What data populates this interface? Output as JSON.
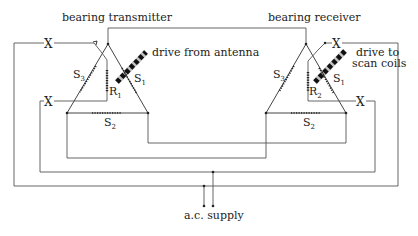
{
  "labels": {
    "transmitter": "bearing transmitter",
    "receiver": "bearing receiver",
    "drive_from": "drive from antenna",
    "drive_to_line1": "drive to",
    "drive_to_line2": "scan coils",
    "supply": "a.c. supply",
    "cross": "X"
  },
  "transmitter_windings": {
    "s1": {
      "letter": "S",
      "sub": "1"
    },
    "s2": {
      "letter": "S",
      "sub": "2"
    },
    "s3": {
      "letter": "S",
      "sub": "3"
    },
    "rotor": {
      "letter": "R",
      "sub": "1"
    }
  },
  "receiver_windings": {
    "s1": {
      "letter": "S",
      "sub": "1"
    },
    "s2": {
      "letter": "S",
      "sub": "2"
    },
    "s3": {
      "letter": "S",
      "sub": "3"
    },
    "rotor": {
      "letter": "R",
      "sub": "2"
    }
  },
  "colors": {
    "line": "#555555",
    "ink": "#222222"
  }
}
